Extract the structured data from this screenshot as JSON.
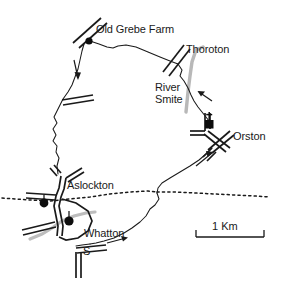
{
  "map": {
    "type": "route-map",
    "title": "",
    "background_color": "#ffffff",
    "ink_color": "#1a1a1a",
    "river_color": "#b3b3b3",
    "labels": {
      "old_grebe_farm": "Old Grebe Farm",
      "thoroton": "Thoroton",
      "river_smite_line1": "River",
      "river_smite_line2": "Smite",
      "orston": "Orston",
      "aslockton": "Aslockton",
      "whatton": "Whatton",
      "station_marker": "S"
    },
    "scale_bar": {
      "label": "1 Km",
      "length_px": 68
    },
    "features": {
      "route_style": "solid thin line, closed loop",
      "railway_style": "dotted horizontal line",
      "river_style": "thick light grey line",
      "road_style": "double parallel lines",
      "site_marker": "filled black circle",
      "church_marker": "black square with cross"
    },
    "direction_arrows": [
      {
        "name": "arrow-north-west-leg",
        "direction": "down"
      },
      {
        "name": "arrow-river-smite-leg",
        "direction": "up-left"
      },
      {
        "name": "arrow-orston-leg",
        "direction": "up-right"
      },
      {
        "name": "arrow-whatton-leg",
        "direction": "right"
      }
    ]
  }
}
